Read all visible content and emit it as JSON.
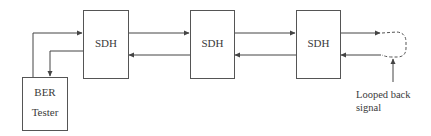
{
  "diagram": {
    "type": "block-diagram",
    "nodes": [
      {
        "id": "sdh1",
        "label": "SDH"
      },
      {
        "id": "sdh2",
        "label": "SDH"
      },
      {
        "id": "sdh3",
        "label": "SDH"
      },
      {
        "id": "ber",
        "label_line1": "BER",
        "label_line2": "Tester"
      }
    ],
    "edges": [
      {
        "from": "ber",
        "to": "sdh1",
        "direction": "forward"
      },
      {
        "from": "sdh1",
        "to": "sdh2",
        "direction": "forward"
      },
      {
        "from": "sdh2",
        "to": "sdh3",
        "direction": "forward"
      },
      {
        "from": "sdh3",
        "to": "loop",
        "direction": "forward"
      },
      {
        "from": "loop",
        "to": "sdh3",
        "direction": "return"
      },
      {
        "from": "sdh3",
        "to": "sdh2",
        "direction": "return"
      },
      {
        "from": "sdh2",
        "to": "sdh1",
        "direction": "return"
      },
      {
        "from": "sdh1",
        "to": "ber",
        "direction": "return"
      }
    ],
    "loop": {
      "style": "dashed"
    },
    "annotation": {
      "line1": "Looped back",
      "line2": "signal"
    },
    "colors": {
      "line": "#444444",
      "box_border": "#555555",
      "text": "#3a3a3a",
      "background": "#ffffff"
    }
  }
}
